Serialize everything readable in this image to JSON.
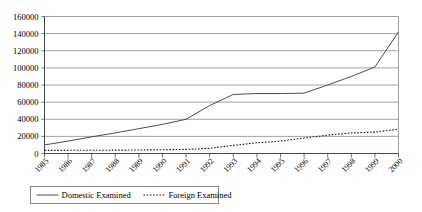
{
  "chart_data": {
    "type": "line",
    "title": "",
    "xlabel": "",
    "ylabel": "",
    "grid": "horizontal",
    "legend_position": "bottom",
    "ylim": [
      0,
      160000
    ],
    "ytick_step": 20000,
    "yticks": [
      "0",
      "20000",
      "40000",
      "60000",
      "80000",
      "100000",
      "120000",
      "140000",
      "160000"
    ],
    "categories": [
      "1985",
      "1986",
      "1987",
      "1988",
      "1989",
      "1990",
      "1991",
      "1992",
      "1993",
      "1994",
      "1995",
      "1996",
      "1997",
      "1998",
      "1999",
      "2000"
    ],
    "series": [
      {
        "name": "Domestic Examined",
        "style": "solid",
        "color": "#3a3a3a",
        "values": [
          10000,
          14500,
          19500,
          24000,
          29000,
          34000,
          40000,
          56000,
          69000,
          70000,
          70000,
          70500,
          80000,
          90000,
          101000,
          142000
        ]
      },
      {
        "name": "Foreign Examined",
        "style": "dotted",
        "color": "#1a1a1a",
        "values": [
          3600,
          3700,
          3800,
          3900,
          4100,
          4400,
          4800,
          6000,
          9500,
          12500,
          14500,
          18000,
          21500,
          24000,
          25000,
          28500
        ]
      }
    ]
  },
  "legend": {
    "entries": [
      {
        "label": "Domestic Examined",
        "marker": "solid-line-marker"
      },
      {
        "label": "Foreign Examined",
        "marker": "dotted-line-marker"
      }
    ]
  }
}
